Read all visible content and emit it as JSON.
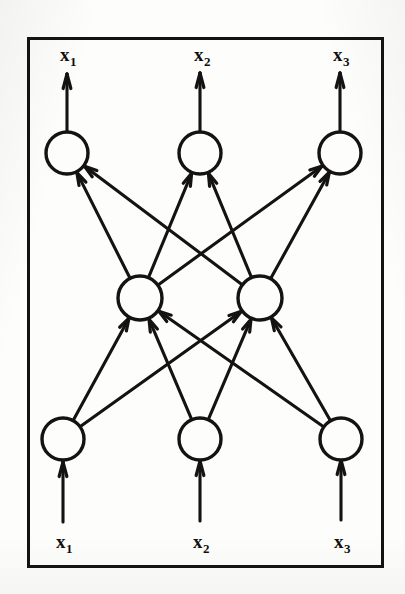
{
  "figure": {
    "kind": "neural-network-diagram",
    "title": "",
    "ink_color": "#141311",
    "paper_color": "#fdfdfb",
    "frame": {
      "x": 27,
      "y": 37,
      "width": 357,
      "height": 531,
      "stroke_width": 3
    }
  },
  "layers": {
    "output": {
      "name": "output-layer",
      "node_radius": 21,
      "cy": 153,
      "nodes": [
        {
          "id": "out-1",
          "cx": 67,
          "label": "x",
          "subscript": "1"
        },
        {
          "id": "out-2",
          "cx": 200,
          "label": "x",
          "subscript": "2"
        },
        {
          "id": "out-3",
          "cx": 340,
          "label": "x",
          "subscript": "3"
        }
      ]
    },
    "hidden": {
      "name": "hidden-layer",
      "node_radius": 22,
      "cy": 298,
      "nodes": [
        {
          "id": "hid-1",
          "cx": 140
        },
        {
          "id": "hid-2",
          "cx": 260
        }
      ]
    },
    "input": {
      "name": "input-layer",
      "node_radius": 21,
      "cy": 439,
      "nodes": [
        {
          "id": "in-1",
          "cx": 63,
          "label": "x",
          "subscript": "1"
        },
        {
          "id": "in-2",
          "cx": 200,
          "label": "x",
          "subscript": "2"
        },
        {
          "id": "in-3",
          "cx": 341,
          "label": "x",
          "subscript": "3"
        }
      ]
    }
  },
  "labels": {
    "output": [
      {
        "id": "label-out-1",
        "text": "x",
        "subscript": "1",
        "x": 60,
        "y": 45
      },
      {
        "id": "label-out-2",
        "text": "x",
        "subscript": "2",
        "x": 194,
        "y": 45
      },
      {
        "id": "label-out-3",
        "text": "x",
        "subscript": "3",
        "x": 333,
        "y": 45
      }
    ],
    "input": [
      {
        "id": "label-in-1",
        "text": "x",
        "subscript": "1",
        "x": 56,
        "y": 532
      },
      {
        "id": "label-in-2",
        "text": "x",
        "subscript": "2",
        "x": 193,
        "y": 532
      },
      {
        "id": "label-in-3",
        "text": "x",
        "subscript": "3",
        "x": 334,
        "y": 532
      }
    ]
  },
  "external_arrows": {
    "output_arrows": [
      {
        "id": "out-arrow-1",
        "x": 67,
        "y1": 132,
        "y2": 74
      },
      {
        "id": "out-arrow-2",
        "x": 200,
        "y1": 131,
        "y2": 73
      },
      {
        "id": "out-arrow-3",
        "x": 340,
        "y1": 131,
        "y2": 73
      }
    ],
    "input_arrows": [
      {
        "id": "in-arrow-1",
        "x": 63,
        "y1": 522,
        "y2": 462
      },
      {
        "id": "in-arrow-2",
        "x": 200,
        "y1": 521,
        "y2": 461
      },
      {
        "id": "in-arrow-3",
        "x": 341,
        "y1": 520,
        "y2": 460
      }
    ]
  },
  "edges": {
    "input_to_hidden": [
      {
        "id": "edge-in1-hid1",
        "from": "in-1",
        "to": "hid-1"
      },
      {
        "id": "edge-in1-hid2",
        "from": "in-1",
        "to": "hid-2"
      },
      {
        "id": "edge-in2-hid1",
        "from": "in-2",
        "to": "hid-1"
      },
      {
        "id": "edge-in2-hid2",
        "from": "in-2",
        "to": "hid-2"
      },
      {
        "id": "edge-in3-hid1",
        "from": "in-3",
        "to": "hid-1"
      },
      {
        "id": "edge-in3-hid2",
        "from": "in-3",
        "to": "hid-2"
      }
    ],
    "hidden_to_output": [
      {
        "id": "edge-hid1-out1",
        "from": "hid-1",
        "to": "out-1"
      },
      {
        "id": "edge-hid1-out2",
        "from": "hid-1",
        "to": "out-2"
      },
      {
        "id": "edge-hid1-out3",
        "from": "hid-1",
        "to": "out-3"
      },
      {
        "id": "edge-hid2-out1",
        "from": "hid-2",
        "to": "out-1"
      },
      {
        "id": "edge-hid2-out2",
        "from": "hid-2",
        "to": "out-2"
      },
      {
        "id": "edge-hid2-out3",
        "from": "hid-2",
        "to": "out-3"
      }
    ]
  }
}
